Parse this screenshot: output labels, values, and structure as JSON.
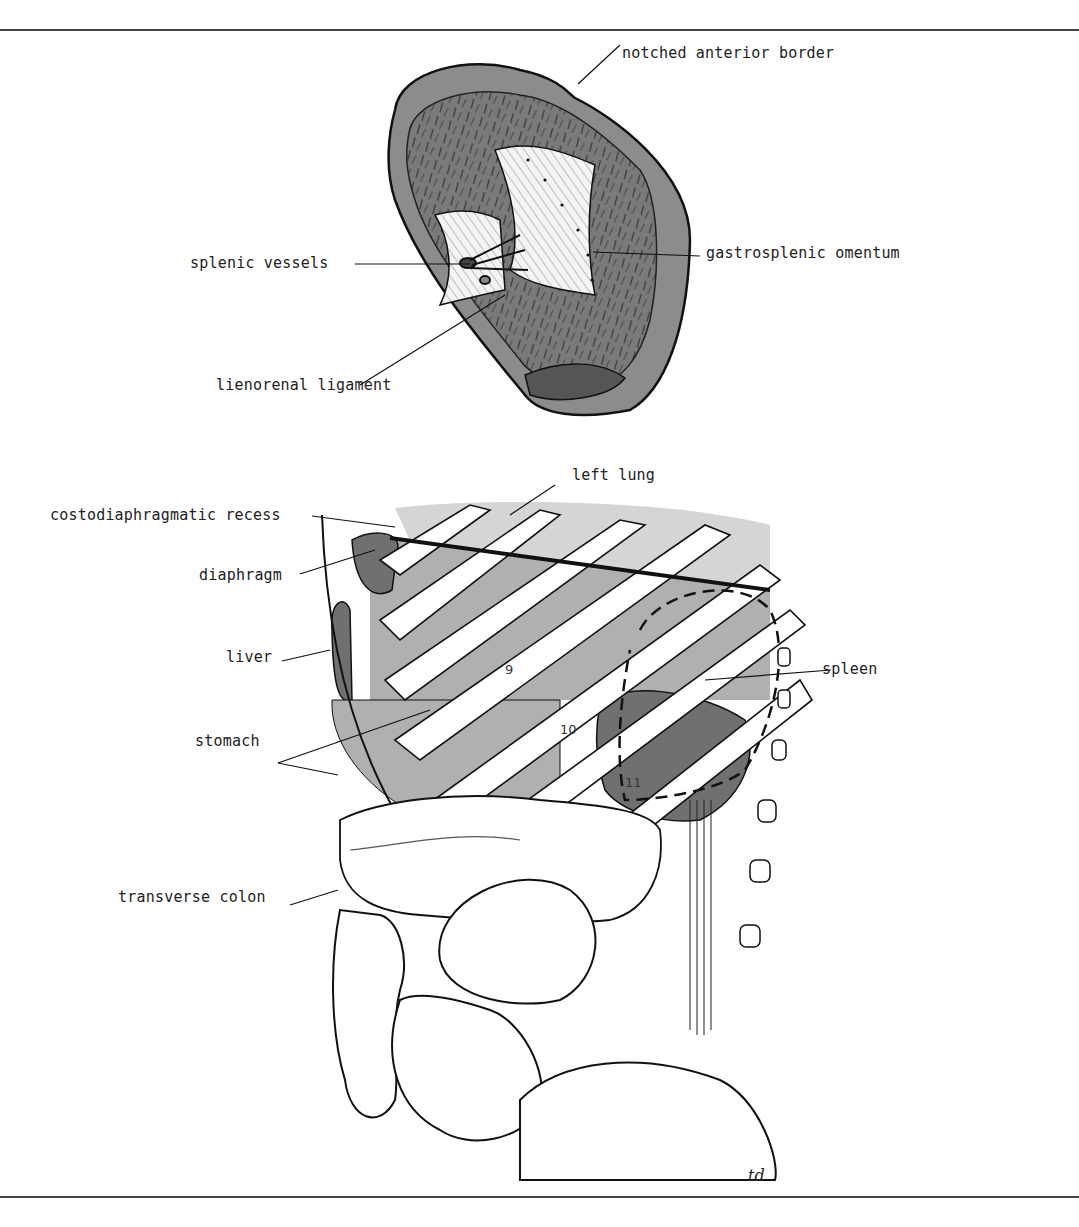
{
  "figure": {
    "upper": {
      "title": "spleen visceral surface",
      "labels": {
        "notched_anterior_border": "notched anterior border",
        "splenic_vessels": "splenic vessels",
        "gastrosplenic_omentum": "gastrosplenic omentum",
        "lienorenal_ligament": "lienorenal ligament"
      }
    },
    "lower": {
      "labels": {
        "left_lung": "left lung",
        "costodiaphragmatic_recess": "costodiaphragmatic recess",
        "diaphragm": "diaphragm",
        "liver": "liver",
        "stomach": "stomach",
        "spleen": "spleen",
        "transverse_colon": "transverse colon"
      },
      "rib_numbers": [
        "9",
        "10",
        "11"
      ]
    },
    "signature": "td",
    "colors": {
      "organ_dark": "#6e6e6e",
      "organ_mid": "#a9a9a9",
      "organ_light": "#d2d2d2",
      "line": "#1a1a1a",
      "rule": "#444444"
    }
  }
}
